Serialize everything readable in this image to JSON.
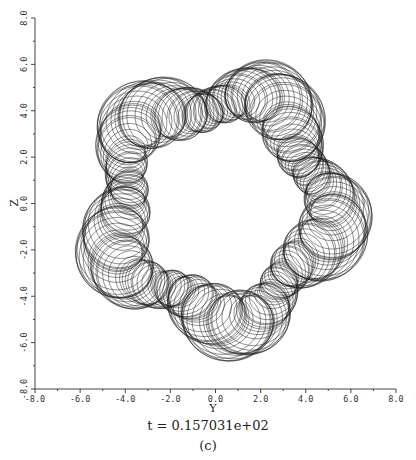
{
  "chart_data": {
    "type": "line",
    "title": "",
    "xlabel": "Y",
    "ylabel": "Z",
    "xlim": [
      -8.0,
      8.0
    ],
    "ylim": [
      -8.0,
      8.0
    ],
    "xticks": [
      "-8.0",
      "-6.0",
      "-4.0",
      "-2.0",
      "0.0",
      "2.0",
      "4.0",
      "6.0",
      "8.0"
    ],
    "yticks": [
      "-8.0",
      "-6.0",
      "-4.0",
      "-2.0",
      "0.0",
      "2.0",
      "4.0",
      "6.0",
      "8.0"
    ],
    "grid": false,
    "legend": null,
    "series": [
      {
        "name": "trajectory",
        "description": "Dense quasi-periodic trajectory forming a five-lobed annulus centred near (0.2, -0.1); inner hole radius ~3, outer extent ~6.5",
        "center": [
          0.2,
          -0.1
        ],
        "mean_radius": 4.7,
        "lobes": 5,
        "lobe_amplitude": 0.55,
        "loop_amplitude": 1.35,
        "extent": {
          "y_min": -6.3,
          "y_max": 6.8,
          "z_min": -6.6,
          "z_max": 6.4
        }
      }
    ]
  },
  "annotation": {
    "time_caption": "t = 0.157031e+02",
    "panel_label": "(c)"
  }
}
